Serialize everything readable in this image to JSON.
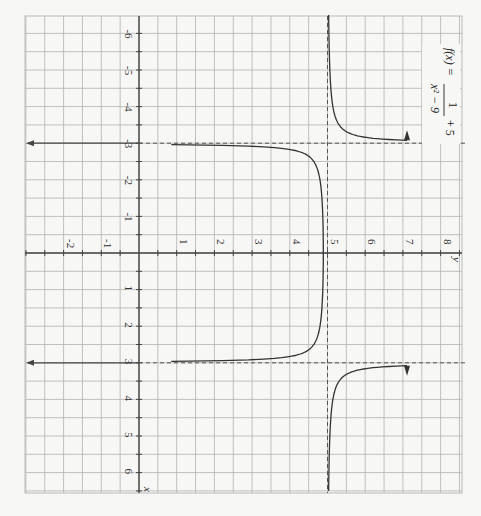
{
  "chart_data": {
    "type": "line",
    "function": "f(x) = 1/(x^2 - 9) + 5",
    "orientation": "rotated 90 degrees clockwise (x-axis runs vertically, y-axis runs horizontally)",
    "xlabel": "x",
    "ylabel": "y",
    "xlim": [
      -6.5,
      6.5
    ],
    "ylim": [
      -3,
      8.6
    ],
    "x_ticks": [
      -6,
      -5,
      -4,
      -3,
      -2,
      -1,
      1,
      2,
      3,
      4,
      5,
      6
    ],
    "y_ticks": [
      -2,
      -1,
      1,
      2,
      3,
      4,
      5,
      6,
      7,
      8
    ],
    "x_tick_labels": [
      "-6",
      "-5",
      "-4",
      "-3",
      "-2",
      "-1",
      "1",
      "2",
      "3",
      "4",
      "5",
      "6"
    ],
    "y_tick_labels": [
      "-2",
      "-1",
      "1",
      "2",
      "3",
      "4",
      "5",
      "6",
      "7",
      "8"
    ],
    "grid": true,
    "asymptotes": {
      "vertical": [
        -3,
        3
      ],
      "horizontal": [
        5
      ]
    },
    "series": [
      {
        "name": "left branch",
        "x_range": [
          -6.5,
          -3.05
        ],
        "note": "approaches y=5 from above as x→-∞, rises toward +∞ as x→-3⁻",
        "points": [
          [
            -6.5,
            5.03
          ],
          [
            -5,
            5.0625
          ],
          [
            -4,
            5.143
          ],
          [
            -3.5,
            5.308
          ],
          [
            -3.2,
            5.806
          ],
          [
            -3.1,
            6.64
          ]
        ]
      },
      {
        "name": "middle branch",
        "x_range": [
          -2.95,
          2.95
        ],
        "note": "downward branch, max at (0, 4.889), to -∞ near x=±3",
        "points": [
          [
            -2.9,
            -6.0
          ],
          [
            -2.7,
            3.12
          ],
          [
            -2,
            4.8
          ],
          [
            0,
            4.889
          ],
          [
            2,
            4.8
          ],
          [
            2.7,
            3.12
          ],
          [
            2.9,
            -6.0
          ]
        ]
      },
      {
        "name": "right branch",
        "x_range": [
          3.05,
          6.5
        ],
        "note": "mirror of left branch",
        "points": [
          [
            3.1,
            6.64
          ],
          [
            3.2,
            5.806
          ],
          [
            3.5,
            5.308
          ],
          [
            4,
            5.143
          ],
          [
            5,
            5.0625
          ],
          [
            6.5,
            5.03
          ]
        ]
      }
    ],
    "annotations": [
      "f(x) = 1/(x² − 9) + 5"
    ]
  },
  "labels": {
    "x_axis_var": "x",
    "y_axis_var": "y",
    "formula_lhs": "f(x) =",
    "formula_num": "1",
    "formula_den": "x² − 9",
    "formula_tail": "+ 5"
  },
  "colors": {
    "background": "#f7f7f5",
    "grid": "#b9b9b9",
    "axis": "#444444",
    "curve": "#333333",
    "asymptote": "#555555"
  }
}
